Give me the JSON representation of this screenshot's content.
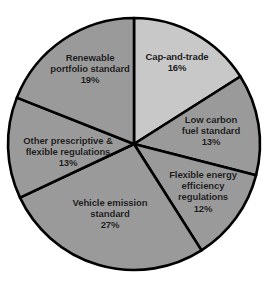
{
  "chart_data": {
    "type": "pie",
    "title": "",
    "subtitle": "",
    "xlabel": "",
    "ylabel": "",
    "legend_position": "none",
    "grid": false,
    "start_angle_deg": 0,
    "direction": "clockwise",
    "units": "percent",
    "total": 100,
    "categories": [
      "Cap-and-trade",
      "Low carbon fuel standard",
      "Flexible energy efficiency regulations",
      "Vehicle emission standard",
      "Other prescriptive & flexible regulations",
      "Renewable portfolio standard"
    ],
    "values": [
      16,
      13,
      12,
      27,
      13,
      19
    ],
    "colors": [
      "#c8c8c8",
      "#9a9a9a",
      "#9a9a9a",
      "#9a9a9a",
      "#9a9a9a",
      "#9a9a9a"
    ],
    "slices": [
      {
        "name": "Cap-and-trade",
        "value": 16,
        "value_label": "16%",
        "color": "#c8c8c8",
        "label_lines": [
          "Cap-and-trade"
        ],
        "label_x": 177,
        "label_y": 62
      },
      {
        "name": "Low carbon fuel standard",
        "value": 13,
        "value_label": "13%",
        "color": "#9a9a9a",
        "label_lines": [
          "Low carbon",
          "fuel standard"
        ],
        "label_x": 211,
        "label_y": 131
      },
      {
        "name": "Flexible energy efficiency regulations",
        "value": 12,
        "value_label": "12%",
        "color": "#9a9a9a",
        "label_lines": [
          "Flexible energy",
          "efficiency",
          "regulations"
        ],
        "label_x": 203,
        "label_y": 192
      },
      {
        "name": "Vehicle emission standard",
        "value": 27,
        "value_label": "27%",
        "color": "#9a9a9a",
        "label_lines": [
          "Vehicle emission",
          "standard"
        ],
        "label_x": 110,
        "label_y": 214
      },
      {
        "name": "Other prescriptive & flexible regulations",
        "value": 13,
        "value_label": "13%",
        "color": "#9a9a9a",
        "label_lines": [
          "Other prescriptive &",
          "flexible regulations"
        ],
        "label_x": 68,
        "label_y": 152
      },
      {
        "name": "Renewable portfolio standard",
        "value": 19,
        "value_label": "19%",
        "color": "#9a9a9a",
        "label_lines": [
          "Renewable",
          "portfolio standard"
        ],
        "label_x": 90,
        "label_y": 69
      }
    ],
    "geometry": {
      "center_x": 134,
      "center_y": 144,
      "radius": 126,
      "stroke_color": "#000000",
      "stroke_width": 2.6
    },
    "background_color": "#ffffff"
  }
}
